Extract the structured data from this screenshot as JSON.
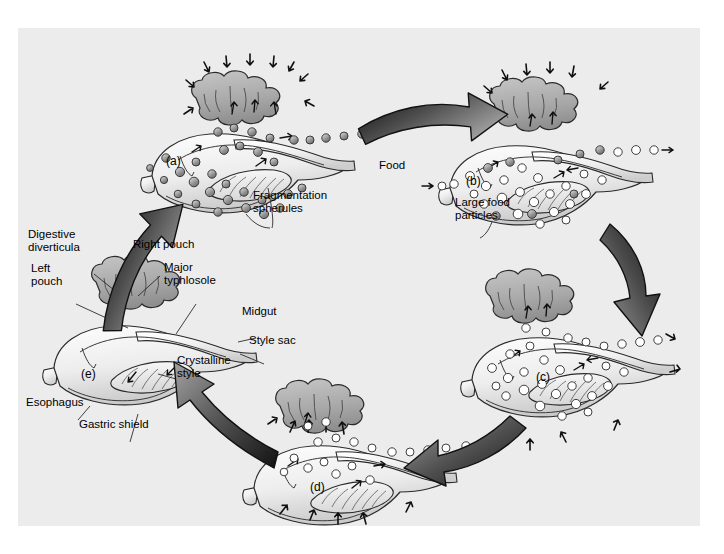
{
  "figure": {
    "background_color": "#ffffff",
    "panel_color": "#ececed"
  },
  "stages": [
    {
      "id": "a",
      "letter": "(a)",
      "x": 148,
      "y": 132,
      "description": "Fragmentation spherules released from digestive diverticula",
      "particle_fill": "gray"
    },
    {
      "id": "b",
      "letter": "(b)",
      "x": 448,
      "y": 152,
      "description": "Large food particles entering stomach with food",
      "particle_fill": "mixed"
    },
    {
      "id": "c",
      "letter": "(c)",
      "x": 518,
      "y": 348,
      "description": "Food particles distributed through stomach",
      "particle_fill": "white"
    },
    {
      "id": "d",
      "letter": "(d)",
      "x": 292,
      "y": 458,
      "description": "Particles absorbed into digestive diverticula",
      "particle_fill": "white"
    },
    {
      "id": "e",
      "letter": "(e)",
      "x": 63,
      "y": 345,
      "description": "Labeled anatomical reference diagram",
      "particle_fill": "none"
    }
  ],
  "labels": {
    "digestive_diverticula": "Digestive\ndiverticula",
    "right_pouch": "Right pouch",
    "left_pouch": "Left\npouch",
    "major_typhlosole": "Major\ntyphlosole",
    "midgut": "Midgut",
    "style_sac": "Style sac",
    "crystalline_style": "Crystalline\nstyle",
    "esophagus": "Esophagus",
    "gastric_shield": "Gastric shield",
    "fragmentation_spherules": "Fragmentation\nspherules",
    "large_food_particles": "Large food\nparticles",
    "food": "Food"
  },
  "label_positions": {
    "digestive_diverticula": {
      "x": 28,
      "y": 228
    },
    "right_pouch": {
      "x": 133,
      "y": 238
    },
    "left_pouch": {
      "x": 31,
      "y": 262
    },
    "major_typhlosole": {
      "x": 164,
      "y": 261
    },
    "midgut": {
      "x": 242,
      "y": 305
    },
    "style_sac": {
      "x": 249,
      "y": 334
    },
    "crystalline_style": {
      "x": 177,
      "y": 354
    },
    "esophagus": {
      "x": 26,
      "y": 396
    },
    "gastric_shield": {
      "x": 79,
      "y": 418
    },
    "fragmentation_spherules": {
      "x": 253,
      "y": 189
    },
    "large_food_particles": {
      "x": 455,
      "y": 196
    },
    "food": {
      "x": 379,
      "y": 159
    }
  },
  "arrows": {
    "cycle_arrow_count": 5,
    "direction": "clockwise",
    "color_dark": "#1b1b1b",
    "color_light": "#9b9b9b",
    "sequence": [
      "a",
      "b",
      "c",
      "d",
      "e",
      "a"
    ]
  },
  "colors": {
    "outline": "#222222",
    "organ_light": "#f2f2f2",
    "organ_mid": "#d0d0d0",
    "diverticula": "#a9a9a9",
    "spherule_gray": "#8e8e8e",
    "spherule_white": "#ffffff",
    "style_fill": "#e4e4e4"
  }
}
